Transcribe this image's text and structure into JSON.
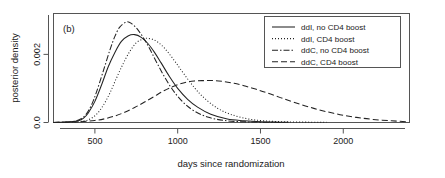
{
  "figure": {
    "panel_label": "(b)"
  },
  "chart_data": {
    "type": "line",
    "title": "",
    "panel_label": "(b)",
    "xlabel": "days since randomization",
    "ylabel": "posterior density",
    "xlim": [
      250,
      2400
    ],
    "ylim": [
      0.0,
      0.0032
    ],
    "grid": false,
    "xticks": [
      500,
      1000,
      1500,
      2000
    ],
    "xticklabels": [
      "500",
      "1000",
      "1500",
      "2000"
    ],
    "yticks": [
      0.0,
      0.002
    ],
    "yticklabels": [
      "0.0",
      "0.002"
    ],
    "legend_position": "top-right",
    "series": [
      {
        "name": "ddI, no CD4 boost",
        "linestyle": "solid",
        "color": "#222222",
        "peak_x": 740,
        "peak_y": 0.00258,
        "x": [
          250,
          300,
          350,
          400,
          430,
          460,
          500,
          540,
          580,
          620,
          660,
          700,
          740,
          780,
          820,
          860,
          900,
          950,
          1000,
          1060,
          1120,
          1200,
          1300,
          1400,
          1500,
          1600,
          1670
        ],
        "y": [
          0.0,
          1e-05,
          2e-05,
          5e-05,
          0.00012,
          0.00028,
          0.00062,
          0.0011,
          0.00163,
          0.00205,
          0.00238,
          0.00254,
          0.00258,
          0.0025,
          0.00232,
          0.00206,
          0.00175,
          0.00135,
          0.001,
          0.00068,
          0.00045,
          0.00024,
          0.0001,
          5e-05,
          2e-05,
          1e-05,
          1e-05
        ]
      },
      {
        "name": "ddI, CD4 boost",
        "linestyle": "dotted",
        "color": "#222222",
        "peak_x": 820,
        "peak_y": 0.00247,
        "x": [
          250,
          350,
          430,
          470,
          510,
          550,
          590,
          630,
          670,
          710,
          750,
          790,
          820,
          860,
          900,
          940,
          990,
          1040,
          1100,
          1160,
          1240,
          1320,
          1420,
          1520,
          1650,
          1800,
          1900
        ],
        "y": [
          0.0,
          1e-05,
          4e-05,
          0.0001,
          0.00024,
          0.0005,
          0.00086,
          0.0013,
          0.00172,
          0.00208,
          0.00234,
          0.00245,
          0.00247,
          0.00242,
          0.00228,
          0.00207,
          0.00175,
          0.00141,
          0.00103,
          0.00072,
          0.00042,
          0.00024,
          0.00011,
          5e-05,
          2e-05,
          1e-05,
          1e-05
        ]
      },
      {
        "name": "ddC, no CD4 boost",
        "linestyle": "dashdot",
        "color": "#222222",
        "peak_x": 690,
        "peak_y": 0.00295,
        "x": [
          250,
          320,
          380,
          420,
          450,
          480,
          510,
          550,
          590,
          620,
          650,
          690,
          720,
          760,
          800,
          840,
          880,
          930,
          980,
          1040,
          1100,
          1180,
          1280,
          1400,
          1520,
          1650
        ],
        "y": [
          0.0,
          1e-05,
          4e-05,
          0.00012,
          0.00026,
          0.00052,
          0.0009,
          0.0015,
          0.00212,
          0.00252,
          0.0028,
          0.00295,
          0.00291,
          0.00272,
          0.00243,
          0.00208,
          0.0017,
          0.00126,
          0.00089,
          0.00056,
          0.00034,
          0.00016,
          6e-05,
          2e-05,
          1e-05,
          0.0
        ]
      },
      {
        "name": "ddC, CD4 boost",
        "linestyle": "dashed",
        "color": "#222222",
        "peak_x": 1220,
        "peak_y": 0.00123,
        "x": [
          250,
          400,
          500,
          560,
          620,
          680,
          740,
          800,
          860,
          920,
          980,
          1040,
          1100,
          1160,
          1220,
          1280,
          1340,
          1400,
          1470,
          1540,
          1620,
          1700,
          1790,
          1880,
          1980,
          2080,
          2180,
          2290,
          2390
        ],
        "y": [
          0.0,
          2e-05,
          6e-05,
          0.00011,
          0.00019,
          0.0003,
          0.00044,
          0.0006,
          0.00077,
          0.00094,
          0.00107,
          0.00117,
          0.00122,
          0.00123,
          0.00123,
          0.0012,
          0.00115,
          0.00108,
          0.00098,
          0.00087,
          0.00073,
          0.0006,
          0.00046,
          0.00034,
          0.00023,
          0.00015,
          9e-05,
          5e-05,
          2e-05
        ]
      }
    ]
  }
}
